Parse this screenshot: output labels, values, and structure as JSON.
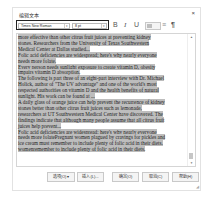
{
  "dialog": {
    "title": "编辑文本",
    "close_label": "×"
  },
  "toolbar": {
    "font_family": "Times New Roman",
    "font_size": "8 pt",
    "bold_label": "B",
    "italic_label": "I",
    "underline_label": "U",
    "align_icon": "≡",
    "paragraph_icon": "¶"
  },
  "editor": {
    "lines": [
      "more effective than other citrus fruit juices at preventing kidney",
      "stones. Researchers from the University of Texas Southwestern",
      "Medical Center at Dallas studied...",
      "Folic acid deficiencies are widespread; here's why nearly everyone",
      "needs more folate.",
      "Every person needs sunlight exposure to create vitamin D, obesity",
      "impairs vitamin D absorption.",
      "The following is part three of an eight-part interview with Dr. Michael",
      "Holick, author of \"The UV advantage\" and one of the world's most",
      "respected authorities on vitamin D and the health benefits of natural",
      "sunlight. His work can be found at ...",
      "A daily glass of orange juice can help prevent the recurrence of kidney",
      "stones better than other citrus fruit juices such as lemonade,",
      "researchers at UT Southwestern Medical Center have discovered. The",
      "findings indicate that although many people assume that all citrus fruit",
      "juices help prevent...",
      " Folic acid deficiencies are widespread; here's why nearly everyone",
      "needs more folatePregnant women plagued by cravings for pickles and",
      "ice cream must remember to include plenty of folic acid in their diets.",
      "womenremember to include plenty of folic acid in their diets."
    ]
  },
  "buttons": {
    "options": "选项(O)",
    "options_arrow": "▾",
    "insert": "插入(L)...",
    "ok": "确定(O)",
    "cancel": "取消(C)",
    "help": "帮助(H)"
  },
  "colors": {
    "highlight": "#bdbdbd",
    "border": "#c9c9c9"
  }
}
